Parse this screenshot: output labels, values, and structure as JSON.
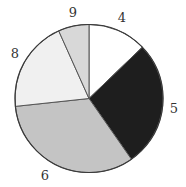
{
  "chart_data": {
    "type": "pie",
    "title": "",
    "categories": [
      "4",
      "5",
      "6",
      "8",
      "9"
    ],
    "values": [
      12.8,
      27.5,
      33.0,
      20.0,
      6.7
    ],
    "colors": [
      "#ffffff",
      "#1e1e1e",
      "#c4c4c4",
      "#f0f0f0",
      "#d8d8d8"
    ],
    "start_angle_deg": 0,
    "direction": "clockwise",
    "legend": "none",
    "labels_outside": true,
    "center": [
      89,
      98.5
    ],
    "radius": 74,
    "label_positions": [
      {
        "label": "4",
        "x": 122,
        "y": 22
      },
      {
        "label": "5",
        "x": 174,
        "y": 113
      },
      {
        "label": "6",
        "x": 45,
        "y": 180
      },
      {
        "label": "8",
        "x": 15,
        "y": 58
      },
      {
        "label": "9",
        "x": 73,
        "y": 17
      }
    ]
  }
}
